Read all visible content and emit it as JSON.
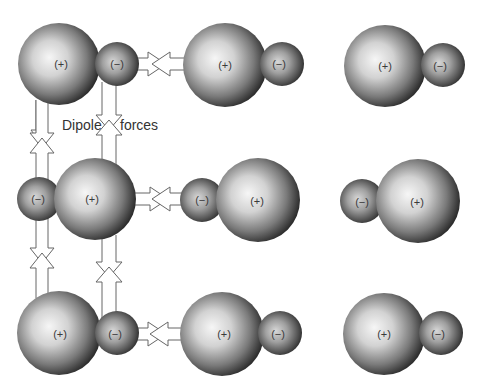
{
  "diagram": {
    "type": "dipole-dipole interaction illustration",
    "label": {
      "word1": "Dipole",
      "word2": "forces"
    },
    "charges": {
      "positive": "(+)",
      "negative": "(−)"
    },
    "molecules": [
      {
        "id": "r1c1",
        "orientation": "positive-left",
        "big": {
          "cx": 59,
          "cy": 64,
          "r": 41
        },
        "small": {
          "cx": 117,
          "cy": 64,
          "r": 22
        }
      },
      {
        "id": "r1c2",
        "orientation": "positive-left",
        "big": {
          "cx": 225,
          "cy": 65,
          "r": 42
        },
        "small": {
          "cx": 282,
          "cy": 64,
          "r": 22
        }
      },
      {
        "id": "r1c3",
        "orientation": "positive-left",
        "big": {
          "cx": 385,
          "cy": 66,
          "r": 41
        },
        "small": {
          "cx": 443,
          "cy": 65,
          "r": 22
        }
      },
      {
        "id": "r2c1",
        "orientation": "negative-left",
        "big": {
          "cx": 95,
          "cy": 199,
          "r": 41
        },
        "small": {
          "cx": 39,
          "cy": 199,
          "r": 22
        }
      },
      {
        "id": "r2c2",
        "orientation": "negative-left",
        "big": {
          "cx": 258,
          "cy": 200,
          "r": 42
        },
        "small": {
          "cx": 202,
          "cy": 200,
          "r": 22
        }
      },
      {
        "id": "r2c3",
        "orientation": "negative-left",
        "big": {
          "cx": 418,
          "cy": 201,
          "r": 42
        },
        "small": {
          "cx": 362,
          "cy": 201,
          "r": 22
        }
      },
      {
        "id": "r3c1",
        "orientation": "positive-left",
        "big": {
          "cx": 59,
          "cy": 333,
          "r": 42
        },
        "small": {
          "cx": 117,
          "cy": 333,
          "r": 22
        }
      },
      {
        "id": "r3c2",
        "orientation": "positive-left",
        "big": {
          "cx": 222,
          "cy": 334,
          "r": 42
        },
        "small": {
          "cx": 280,
          "cy": 333,
          "r": 22
        }
      },
      {
        "id": "r3c3",
        "orientation": "positive-left",
        "big": {
          "cx": 384,
          "cy": 334,
          "r": 41
        },
        "small": {
          "cx": 441,
          "cy": 333,
          "r": 22
        }
      }
    ],
    "force_arrows": [
      {
        "id": "h-row1",
        "direction": "horizontal",
        "between": [
          "r1c1",
          "r1c2"
        ]
      },
      {
        "id": "h-row2",
        "direction": "horizontal",
        "between": [
          "r2c1",
          "r2c2"
        ]
      },
      {
        "id": "h-row3",
        "direction": "horizontal",
        "between": [
          "r3c1",
          "r3c2"
        ]
      },
      {
        "id": "v-left-upper",
        "direction": "vertical",
        "between": [
          "r1c1",
          "r2c1"
        ]
      },
      {
        "id": "v-right-upper",
        "direction": "vertical",
        "between": [
          "r1c1",
          "r2c1"
        ]
      },
      {
        "id": "v-left-lower",
        "direction": "vertical",
        "between": [
          "r2c1",
          "r3c1"
        ]
      },
      {
        "id": "v-right-lower",
        "direction": "vertical",
        "between": [
          "r2c1",
          "r3c1"
        ]
      }
    ],
    "colors": {
      "background": "#ffffff",
      "sphere_highlight": "#f4f4f4",
      "sphere_mid": "#9a9a9a",
      "sphere_edge": "#1e1e1e",
      "arrow_stroke": "#666666",
      "text": "#333333"
    }
  }
}
